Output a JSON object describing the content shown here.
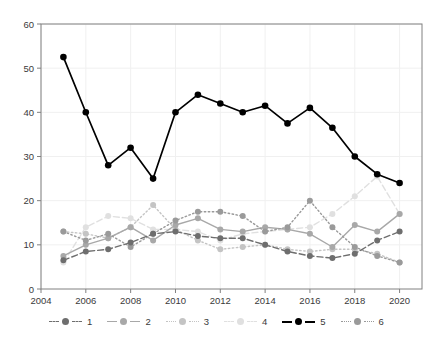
{
  "title": "",
  "chart_data": {
    "type": "line",
    "title": "",
    "xlabel": "",
    "ylabel": "",
    "x": [
      2005,
      2006,
      2007,
      2008,
      2009,
      2010,
      2011,
      2012,
      2013,
      2014,
      2015,
      2016,
      2017,
      2018,
      2019,
      2020
    ],
    "xlim": [
      2004,
      2021
    ],
    "ylim": [
      0,
      60
    ],
    "xticks": [
      2004,
      2006,
      2008,
      2010,
      2012,
      2014,
      2016,
      2018,
      2020
    ],
    "yticks": [
      0,
      10,
      20,
      30,
      40,
      50,
      60
    ],
    "grid": true,
    "legend_position": "bottom",
    "series": [
      {
        "name": "1",
        "color": "#6e6e6e",
        "linestyle": "dashed",
        "values": [
          6.5,
          8.5,
          9.0,
          10.5,
          12.5,
          13.0,
          12.0,
          11.5,
          11.5,
          10.0,
          8.5,
          7.5,
          7.0,
          8.0,
          11.0,
          13.0
        ]
      },
      {
        "name": "2",
        "color": "#a8a8a8",
        "linestyle": "solid",
        "values": [
          7.5,
          10.0,
          11.5,
          14.0,
          11.0,
          14.5,
          16.0,
          13.5,
          13.0,
          14.0,
          13.5,
          12.5,
          9.5,
          14.5,
          13.0,
          17.0
        ]
      },
      {
        "name": "3",
        "color": "#c4c4c4",
        "linestyle": "dotted",
        "values": [
          13.0,
          12.5,
          11.5,
          14.0,
          19.0,
          13.5,
          11.0,
          9.0,
          9.5,
          10.0,
          9.0,
          8.5,
          9.0,
          9.0,
          8.0,
          6.0
        ]
      },
      {
        "name": "4",
        "color": "#e0e0e0",
        "linestyle": "dashed",
        "values": [
          6.0,
          14.0,
          16.5,
          16.0,
          13.5,
          13.5,
          13.0,
          11.0,
          12.5,
          13.0,
          13.5,
          14.0,
          17.0,
          21.0,
          25.5,
          17.0
        ]
      },
      {
        "name": "5",
        "color": "#000000",
        "linestyle": "solid",
        "values": [
          52.5,
          40.0,
          28.0,
          32.0,
          25.0,
          40.0,
          44.0,
          42.0,
          40.0,
          41.5,
          37.5,
          41.0,
          36.5,
          30.0,
          26.0,
          24.0
        ]
      },
      {
        "name": "6",
        "color": "#9a9a9a",
        "linestyle": "dotted",
        "values": [
          13.0,
          11.0,
          12.5,
          9.5,
          12.5,
          15.5,
          17.5,
          17.5,
          16.5,
          13.0,
          14.0,
          20.0,
          14.0,
          9.5,
          7.5,
          6.0
        ]
      }
    ]
  },
  "legend": {
    "items": [
      {
        "label": "1"
      },
      {
        "label": "2"
      },
      {
        "label": "3"
      },
      {
        "label": "4"
      },
      {
        "label": "5"
      },
      {
        "label": "6"
      }
    ]
  }
}
